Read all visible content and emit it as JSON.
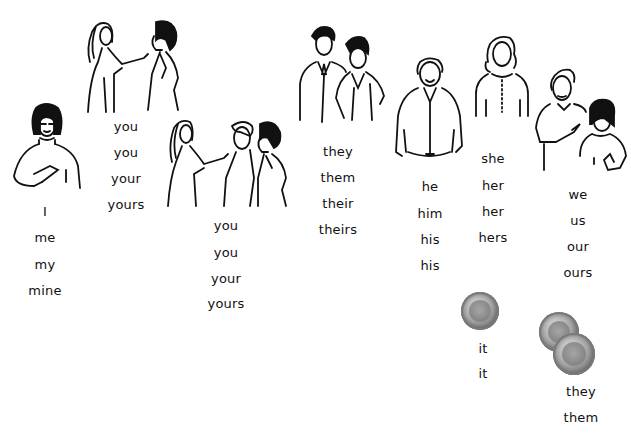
{
  "header": {
    "cut_text": "Pronoun Chart"
  },
  "groups": [
    {
      "id": "first-singular",
      "figure": "woman-pointing-self",
      "words": [
        "I",
        "me",
        "my",
        "mine"
      ]
    },
    {
      "id": "second-singular",
      "figure": "girl-pointing-at-one-person",
      "words": [
        "you",
        "you",
        "your",
        "yours"
      ]
    },
    {
      "id": "second-plural",
      "figure": "girl-pointing-at-two-people",
      "words": [
        "you",
        "you",
        "your",
        "yours"
      ]
    },
    {
      "id": "third-plural-people",
      "figure": "two-people-standing",
      "words": [
        "they",
        "them",
        "their",
        "theirs"
      ]
    },
    {
      "id": "third-masculine",
      "figure": "man-standing",
      "words": [
        "he",
        "him",
        "his",
        "his"
      ]
    },
    {
      "id": "third-feminine",
      "figure": "woman-standing",
      "words": [
        "she",
        "her",
        "her",
        "hers"
      ]
    },
    {
      "id": "first-plural",
      "figure": "man-and-girl-pointing-selves",
      "words": [
        "we",
        "us",
        "our",
        "ours"
      ]
    },
    {
      "id": "third-neuter",
      "figure": "single-coin",
      "words": [
        "it",
        "it"
      ]
    },
    {
      "id": "third-plural-things",
      "figure": "two-coins",
      "words": [
        "they",
        "them"
      ]
    }
  ]
}
